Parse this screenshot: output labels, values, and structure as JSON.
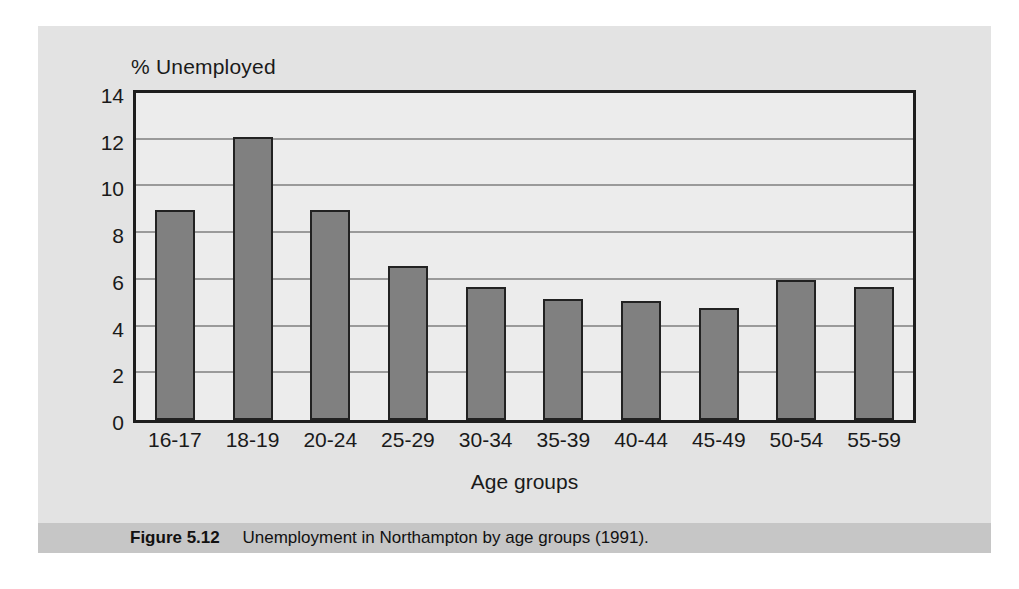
{
  "figure": {
    "caption_label": "Figure 5.12",
    "caption_text": "Unemployment in Northampton by age groups (1991).",
    "background_color": "#e3e3e3",
    "caption_band_color": "#c6c6c6"
  },
  "chart_data": {
    "type": "bar",
    "title": "",
    "xlabel": "Age groups",
    "ylabel": "% Unemployed",
    "categories": [
      "16-17",
      "18-19",
      "20-24",
      "25-29",
      "30-34",
      "35-39",
      "40-44",
      "45-49",
      "50-54",
      "55-59"
    ],
    "values": [
      9.0,
      12.1,
      9.0,
      6.6,
      5.7,
      5.2,
      5.1,
      4.8,
      6.0,
      5.7
    ],
    "ylim": [
      0,
      14
    ],
    "yticks": [
      0,
      2,
      4,
      6,
      8,
      10,
      12,
      14
    ],
    "ytick_labels": [
      "0",
      "2",
      "4",
      "6",
      "8",
      "10",
      "12",
      "14"
    ],
    "grid": true,
    "grid_axis": "y",
    "legend": false,
    "bar_color": "#808080",
    "bar_edge_color": "#222222",
    "plot_background": "#ececec",
    "axis_color": "#1d1d1d",
    "gridline_color": "#9a9a9a"
  }
}
